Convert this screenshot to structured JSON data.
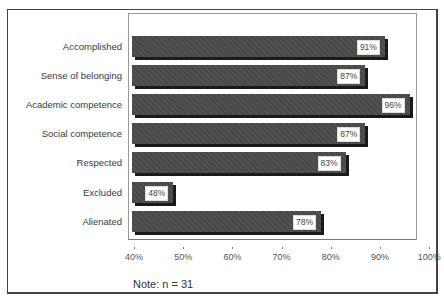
{
  "chart_data": {
    "type": "bar",
    "orientation": "horizontal",
    "title": "",
    "xlabel": "",
    "ylabel": "",
    "categories": [
      "Accomplished",
      "Sense of belonging",
      "Academic competence",
      "Social competence",
      "Respected",
      "Excluded",
      "Alienated"
    ],
    "values": [
      91,
      87,
      96,
      87,
      83,
      48,
      78
    ],
    "value_labels": [
      "91%",
      "87%",
      "96%",
      "87%",
      "83%",
      "48%",
      "78%"
    ],
    "xlim": [
      40,
      100
    ],
    "x_ticks": [
      "40%",
      "50%",
      "60%",
      "70%",
      "80%",
      "90%",
      "100%"
    ],
    "grid": false,
    "legend": null,
    "bar_color": "#4a4a4a",
    "shadow_color": "#1a1a1a",
    "note": "Note: n = 31"
  }
}
